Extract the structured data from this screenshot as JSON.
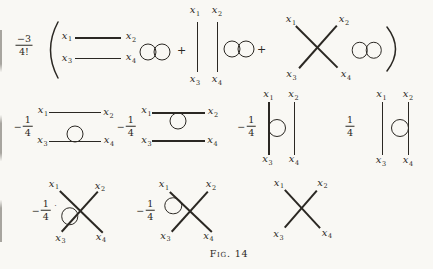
{
  "colors": {
    "paper": "#f9f8f4",
    "ink": "#2b2823"
  },
  "caption": {
    "label": "Fig.",
    "number": "14"
  },
  "labels": {
    "x1": {
      "base": "x",
      "sub": "1"
    },
    "x2": {
      "base": "x",
      "sub": "2"
    },
    "x3": {
      "base": "x",
      "sub": "3"
    },
    "x4": {
      "base": "x",
      "sub": "4"
    }
  },
  "expression": {
    "prefactor": {
      "numerator": "−3",
      "denominator": "4!"
    },
    "open_paren": "(",
    "close_paren": ")",
    "plus": "+"
  },
  "row2": {
    "coef_a": {
      "minus": "−",
      "num": "1",
      "den": "4"
    },
    "coef_b": {
      "minus": "−",
      "num": "1",
      "den": "4"
    },
    "coef_c": {
      "minus": "−",
      "num": "1",
      "den": "4"
    },
    "coef_d": {
      "minus": "",
      "num": "1",
      "den": "4"
    }
  },
  "row3": {
    "coef_a": {
      "minus": "−",
      "num": "1",
      "den": "4"
    },
    "stray_mark": "·",
    "coef_b": {
      "minus": "−",
      "num": "1",
      "den": "4"
    }
  },
  "diagrams": [
    {
      "term": "1a",
      "type": "two horizontal propagators x1–x2, x3–x4",
      "extra": "double vacuum bubble"
    },
    {
      "term": "1b",
      "type": "two vertical propagators x1–x3, x2–x4",
      "extra": "double vacuum bubble"
    },
    {
      "term": "1c",
      "type": "four-point cross vertex",
      "extra": "double vacuum bubble"
    },
    {
      "term": "2a",
      "type": "horizontal propagators",
      "extra": "tadpole loop on x3–x4 line"
    },
    {
      "term": "2b",
      "type": "horizontal propagators",
      "extra": "tadpole loop on x1–x2 line"
    },
    {
      "term": "2c",
      "type": "vertical propagators",
      "extra": "tadpole loop on x1–x3 line"
    },
    {
      "term": "2d",
      "type": "vertical propagators",
      "extra": "tadpole loop on x2–x4 line"
    },
    {
      "term": "3a",
      "type": "cross vertex",
      "extra": "tadpole loop on x3 leg"
    },
    {
      "term": "3b",
      "type": "cross vertex",
      "extra": "tadpole loop on x1 leg"
    },
    {
      "term": "3c",
      "type": "cross vertex",
      "extra": "no loop"
    }
  ]
}
